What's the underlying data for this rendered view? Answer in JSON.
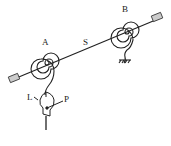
{
  "diagram": {
    "type": "mechanical-schematic",
    "labels": {
      "spring_a": "A",
      "spring_b": "B",
      "shaft": "S",
      "lever": "L",
      "pointer": "P"
    },
    "colors": {
      "line": "#222222",
      "background": "#ffffff",
      "end_cap": "#cccccc"
    }
  }
}
